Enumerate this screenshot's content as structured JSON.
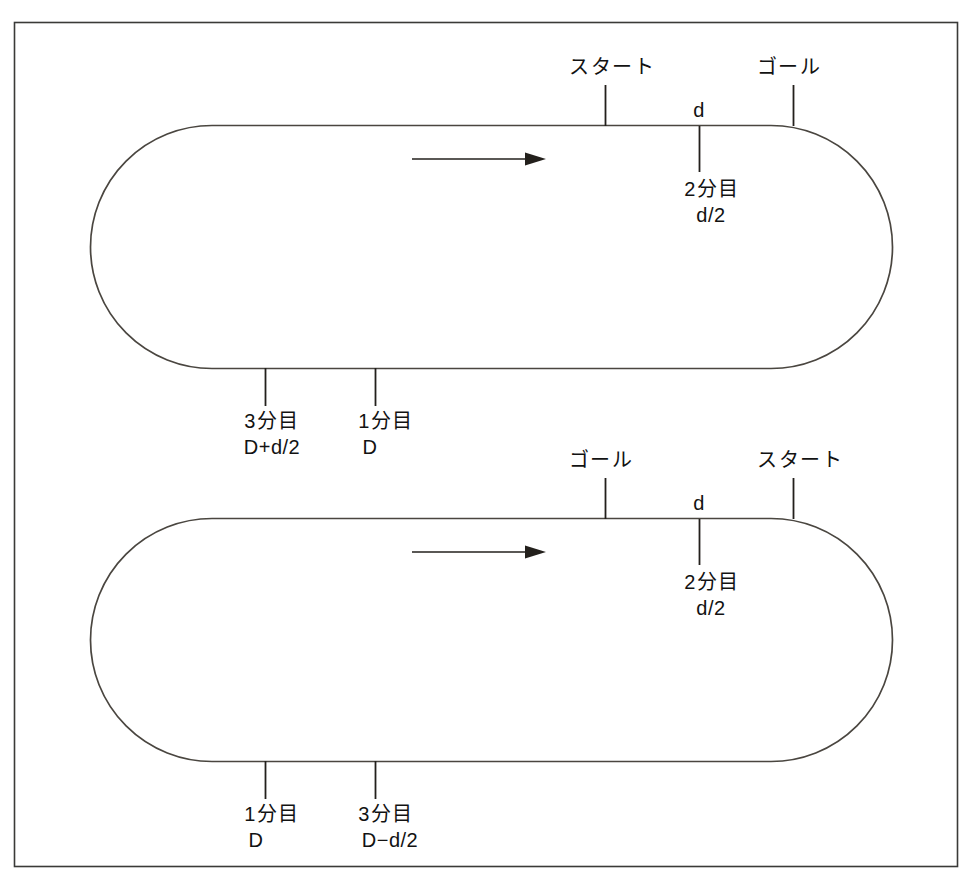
{
  "figure": {
    "type": "technical-diagram",
    "frame": {
      "stroke": "#3a3a38",
      "fill": "#ffffff"
    },
    "track_stroke": "#4a4640",
    "text_color": "#121212"
  },
  "tracks": [
    {
      "id": "upper-track",
      "direction_arrow": "right",
      "top_labels": [
        {
          "name": "start",
          "text": "スタート",
          "x": 605
        },
        {
          "name": "goal",
          "text": "ゴール",
          "x": 793
        }
      ],
      "segment_label": {
        "name": "d",
        "text": "d",
        "x": 699
      },
      "top_marker": {
        "name": "second-split",
        "line1": "2分目",
        "line2": "d/2",
        "x": 699
      },
      "bottom_markers": [
        {
          "name": "third-split",
          "line1": "3分目",
          "line2": "D+d/2",
          "x": 265
        },
        {
          "name": "first-split",
          "line1": "1分目",
          "line2": "D",
          "x": 375
        }
      ]
    },
    {
      "id": "lower-track",
      "direction_arrow": "right",
      "top_labels": [
        {
          "name": "goal",
          "text": "ゴール",
          "x": 605
        },
        {
          "name": "start",
          "text": "スタート",
          "x": 793
        }
      ],
      "segment_label": {
        "name": "d",
        "text": "d",
        "x": 699
      },
      "top_marker": {
        "name": "second-split",
        "line1": "2分目",
        "line2": "d/2",
        "x": 699
      },
      "bottom_markers": [
        {
          "name": "first-split",
          "line1": "1分目",
          "line2": "D",
          "x": 265
        },
        {
          "name": "third-split",
          "line1": "3分目",
          "line2": "D−d/2",
          "x": 375
        }
      ]
    }
  ]
}
